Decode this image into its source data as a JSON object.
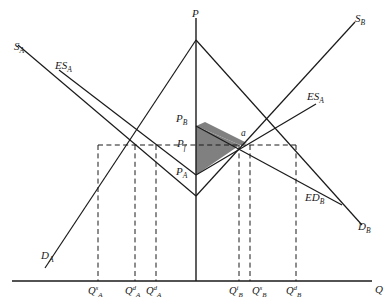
{
  "figure": {
    "type": "economics-diagram",
    "background_color": "#ffffff",
    "line_color": "#1a1a1a",
    "shade_color": "#808080"
  },
  "axes": {
    "vertical_label": "P",
    "horizontal_label": "Q"
  },
  "prices": {
    "pb": {
      "label": "P",
      "sub": "B"
    },
    "pf": {
      "label": "P",
      "sub": "f"
    },
    "pa": {
      "label": "P",
      "sub": "A"
    }
  },
  "point": {
    "equilibrium": "a"
  },
  "curves": [
    {
      "name": "supply-a",
      "label": "S",
      "sub": "A",
      "sup": ""
    },
    {
      "name": "demand-a",
      "label": "D",
      "sub": "A",
      "sup": ""
    },
    {
      "name": "export-supply-a",
      "label": "ES",
      "sub": "A",
      "sup": ""
    },
    {
      "name": "supply-b",
      "label": "S",
      "sub": "B",
      "sup": ""
    },
    {
      "name": "demand-b",
      "label": "D",
      "sub": "B",
      "sup": ""
    },
    {
      "name": "import-demand-b",
      "label": "ED",
      "sub": "B",
      "sup": ""
    },
    {
      "name": "export-supply-a-right",
      "label": "ES",
      "sub": "A",
      "sup": ""
    }
  ],
  "quantities_left": [
    {
      "name": "qa-s",
      "label": "Q",
      "sub": "A",
      "sup": "s"
    },
    {
      "name": "qa-d1",
      "label": "Q",
      "sub": "A",
      "sup": "d"
    },
    {
      "name": "qa-d2",
      "label": "Q",
      "sub": "A",
      "sup": "d"
    }
  ],
  "quantities_right": [
    {
      "name": "qb-i",
      "label": "Q",
      "sub": "B",
      "sup": "i"
    },
    {
      "name": "qb-s",
      "label": "Q",
      "sub": "B",
      "sup": "s"
    },
    {
      "name": "qb-d",
      "label": "Q",
      "sub": "B",
      "sup": "d"
    }
  ]
}
